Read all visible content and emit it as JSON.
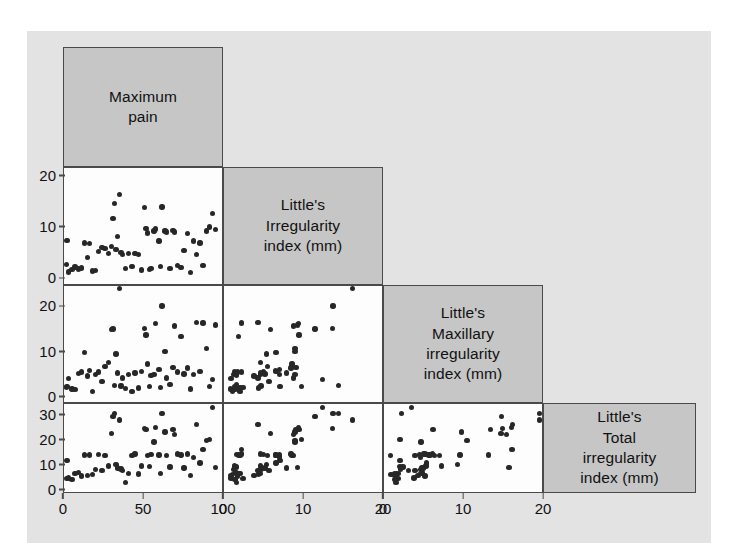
{
  "figure": {
    "kind": "scatterplot-matrix",
    "background_color": "#e3e3e3",
    "panel_color": "#fdfdfd",
    "diagonal_color": "#c6c6c6",
    "border_color": "#4a4a4a",
    "point_color": "#272727"
  },
  "variables": [
    {
      "key": "pain",
      "label": "Maximum\npain",
      "x_ticks": [
        "0",
        "50",
        "100"
      ],
      "x_min": 0,
      "x_max": 100,
      "y_ticks": [],
      "y_min": 0,
      "y_max": 100
    },
    {
      "key": "little",
      "label": "Little's\nIrregularity\nindex (mm)",
      "x_ticks": [
        "0",
        "10",
        "20"
      ],
      "x_min": 0,
      "x_max": 20,
      "y_ticks": [
        "0",
        "10",
        "20"
      ],
      "y_min": -1.5,
      "y_max": 21.5
    },
    {
      "key": "maxillary",
      "label": "Little's\nMaxillary\nirregularity\nindex (mm)",
      "x_ticks": [
        "0",
        "10",
        "20"
      ],
      "x_min": 0,
      "x_max": 20,
      "y_ticks": [
        "0",
        "10",
        "20"
      ],
      "y_min": -1.5,
      "y_max": 24.5
    },
    {
      "key": "total",
      "label": "Little's\nTotal\nirregularity\nindex (mm)",
      "x_ticks": [],
      "x_min": 0,
      "x_max": 35,
      "y_ticks": [
        "0",
        "10",
        "20",
        "30"
      ],
      "y_min": -1.5,
      "y_max": 34.5
    }
  ],
  "chart_data": {
    "type": "scatter",
    "title": "",
    "xlabel": "",
    "ylabel": "",
    "grid": false,
    "legend": "none",
    "layout": "lower-triangular scatterplot matrix, 4 variables, diagonal cells contain variable name labels",
    "axis_ranges": {
      "pain": [
        0,
        100
      ],
      "little": [
        0,
        20
      ],
      "maxillary": [
        0,
        20
      ],
      "total": [
        0,
        35
      ]
    },
    "variables": [
      "Maximum pain",
      "Little's Irregularity index (mm)",
      "Little's Maxillary irregularity index (mm)",
      "Little's Total irregularity index (mm)"
    ],
    "observations": [
      {
        "pain": 1,
        "little": 2.4,
        "maxillary": 1.8,
        "total": 4.0
      },
      {
        "pain": 2,
        "little": 7.1,
        "maxillary": 2.0,
        "total": 11.5
      },
      {
        "pain": 3,
        "little": 0.9,
        "maxillary": 3.8,
        "total": 4.3
      },
      {
        "pain": 5,
        "little": 1.4,
        "maxillary": 1.4,
        "total": 3.6
      },
      {
        "pain": 7,
        "little": 1.9,
        "maxillary": 1.3,
        "total": 6.0
      },
      {
        "pain": 9,
        "little": 1.5,
        "maxillary": 4.9,
        "total": 6.4
      },
      {
        "pain": 11,
        "little": 1.7,
        "maxillary": 5.2,
        "total": 5.1
      },
      {
        "pain": 13,
        "little": 6.6,
        "maxillary": 9.6,
        "total": 13.6
      },
      {
        "pain": 15,
        "little": 3.8,
        "maxillary": 4.3,
        "total": 5.3
      },
      {
        "pain": 16,
        "little": 6.5,
        "maxillary": 5.6,
        "total": 13.7
      },
      {
        "pain": 18,
        "little": 1.1,
        "maxillary": 0.9,
        "total": 5.6
      },
      {
        "pain": 20,
        "little": 1.2,
        "maxillary": 4.6,
        "total": 7.8
      },
      {
        "pain": 22,
        "little": 5.0,
        "maxillary": 5.2,
        "total": 13.8
      },
      {
        "pain": 24,
        "little": 5.7,
        "maxillary": 3.1,
        "total": 7.2
      },
      {
        "pain": 26,
        "little": 5.5,
        "maxillary": 6.4,
        "total": 13.4
      },
      {
        "pain": 28,
        "little": 4.6,
        "maxillary": 7.3,
        "total": 9.1
      },
      {
        "pain": 30,
        "little": 5.9,
        "maxillary": 14.8,
        "total": 22.5
      },
      {
        "pain": 31,
        "little": 11.5,
        "maxillary": 14.9,
        "total": 29.5
      },
      {
        "pain": 32,
        "little": 14.5,
        "maxillary": 2.2,
        "total": 30.5
      },
      {
        "pain": 33,
        "little": 5.4,
        "maxillary": 9.3,
        "total": 9.8
      },
      {
        "pain": 34,
        "little": 7.9,
        "maxillary": 5.0,
        "total": 8.3
      },
      {
        "pain": 35,
        "little": 16.3,
        "maxillary": 24.0,
        "total": 28.0
      },
      {
        "pain": 36,
        "little": 4.7,
        "maxillary": 2.1,
        "total": 7.9
      },
      {
        "pain": 37,
        "little": 4.3,
        "maxillary": 3.9,
        "total": 7.3
      },
      {
        "pain": 39,
        "little": 1.6,
        "maxillary": 1.5,
        "total": 2.4
      },
      {
        "pain": 41,
        "little": 4.6,
        "maxillary": 4.7,
        "total": 6.1
      },
      {
        "pain": 43,
        "little": 2.0,
        "maxillary": 0.8,
        "total": 13.5
      },
      {
        "pain": 45,
        "little": 4.6,
        "maxillary": 5.0,
        "total": 14.0
      },
      {
        "pain": 47,
        "little": 4.4,
        "maxillary": 1.6,
        "total": 5.8
      },
      {
        "pain": 49,
        "little": 1.3,
        "maxillary": 5.3,
        "total": 9.2
      },
      {
        "pain": 51,
        "little": 13.7,
        "maxillary": 15.0,
        "total": 24.5
      },
      {
        "pain": 52,
        "little": 9.5,
        "maxillary": 13.5,
        "total": 24.0
      },
      {
        "pain": 53,
        "little": 8.6,
        "maxillary": 7.0,
        "total": 13.5
      },
      {
        "pain": 54,
        "little": 1.4,
        "maxillary": 2.0,
        "total": 8.9
      },
      {
        "pain": 55,
        "little": 1.6,
        "maxillary": 4.5,
        "total": 13.9
      },
      {
        "pain": 57,
        "little": 9.0,
        "maxillary": 4.7,
        "total": 19.0
      },
      {
        "pain": 58,
        "little": 9.4,
        "maxillary": 16.1,
        "total": 25.0
      },
      {
        "pain": 60,
        "little": 7.0,
        "maxillary": 5.8,
        "total": 13.6
      },
      {
        "pain": 61,
        "little": 2.0,
        "maxillary": 1.8,
        "total": 6.0
      },
      {
        "pain": 62,
        "little": 13.8,
        "maxillary": 20.0,
        "total": 30.5
      },
      {
        "pain": 64,
        "little": 9.0,
        "maxillary": 9.8,
        "total": 23.0
      },
      {
        "pain": 65,
        "little": 8.8,
        "maxillary": 3.9,
        "total": 13.5
      },
      {
        "pain": 67,
        "little": 1.6,
        "maxillary": 2.4,
        "total": 8.8
      },
      {
        "pain": 69,
        "little": 9.1,
        "maxillary": 6.2,
        "total": 24.0
      },
      {
        "pain": 70,
        "little": 8.8,
        "maxillary": 15.5,
        "total": 22.0
      },
      {
        "pain": 72,
        "little": 2.2,
        "maxillary": 5.2,
        "total": 14.0
      },
      {
        "pain": 74,
        "little": 1.8,
        "maxillary": 13.2,
        "total": 13.7
      },
      {
        "pain": 76,
        "little": 5.2,
        "maxillary": 4.8,
        "total": 8.4
      },
      {
        "pain": 78,
        "little": 8.5,
        "maxillary": 6.1,
        "total": 14.0
      },
      {
        "pain": 80,
        "little": 0.8,
        "maxillary": 1.4,
        "total": 5.2
      },
      {
        "pain": 82,
        "little": 7.0,
        "maxillary": 4.6,
        "total": 12.6
      },
      {
        "pain": 84,
        "little": 4.3,
        "maxillary": 16.3,
        "total": 26.0
      },
      {
        "pain": 86,
        "little": 6.6,
        "maxillary": 5.4,
        "total": 10.4
      },
      {
        "pain": 88,
        "little": 2.2,
        "maxillary": 16.2,
        "total": 16.0
      },
      {
        "pain": 90,
        "little": 9.0,
        "maxillary": 10.5,
        "total": 19.5
      },
      {
        "pain": 92,
        "little": 9.8,
        "maxillary": 2.0,
        "total": 20.0
      },
      {
        "pain": 94,
        "little": 12.5,
        "maxillary": 3.5,
        "total": 33.0
      },
      {
        "pain": 96,
        "little": 9.3,
        "maxillary": 15.8,
        "total": 8.6
      }
    ],
    "pairs": [
      {
        "row": "little",
        "col": "pain",
        "relationship": "weak / no clear correlation"
      },
      {
        "row": "maxillary",
        "col": "pain",
        "relationship": "weak positive"
      },
      {
        "row": "maxillary",
        "col": "little",
        "relationship": "moderate positive"
      },
      {
        "row": "total",
        "col": "pain",
        "relationship": "weak positive"
      },
      {
        "row": "total",
        "col": "little",
        "relationship": "strong positive"
      },
      {
        "row": "total",
        "col": "maxillary",
        "relationship": "very strong positive"
      }
    ]
  }
}
